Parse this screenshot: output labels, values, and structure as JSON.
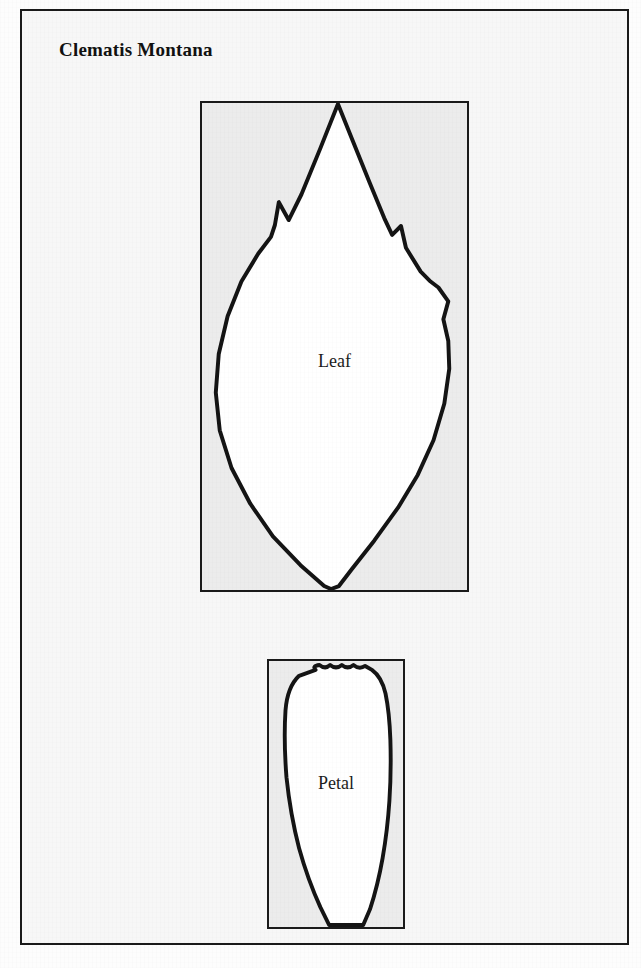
{
  "document": {
    "title": "Clematis Montana",
    "kind": "botanical-specimen-figure",
    "background_color": "#f7f7f7",
    "frame_color": "#1a1a1a"
  },
  "specimens": [
    {
      "id": "leaf",
      "label": "Leaf",
      "outline_color": "#141414",
      "fill_color": "#ffffff",
      "panel_color": "#ececec",
      "shape_description": "ovate-acuminate leaf with pointed apex, three coarse marginal serrations and a narrow cuneate base"
    },
    {
      "id": "petal",
      "label": "Petal",
      "outline_color": "#141414",
      "fill_color": "#ffffff",
      "panel_color": "#ececec",
      "shape_description": "oblong petal with broadly rounded crenulate apex and tapering claw-like base"
    }
  ]
}
